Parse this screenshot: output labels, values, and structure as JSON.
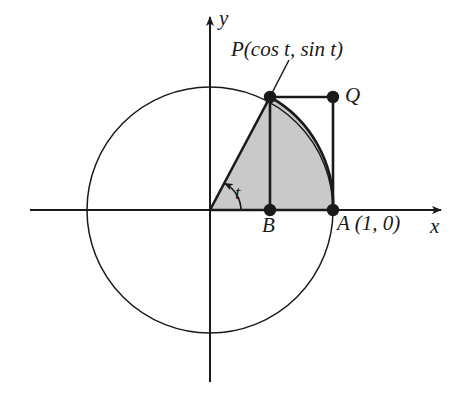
{
  "figure": {
    "kind": "unit-circle-geometry-diagram",
    "background_color": "#ffffff",
    "stroke_color": "#1a1a1a",
    "shade_color": "#c9c9c9",
    "axes": {
      "x_label": "x",
      "y_label": "y",
      "origin_px": [
        210,
        210
      ]
    },
    "circle": {
      "center_px": [
        210,
        210
      ],
      "radius_px": 123,
      "radius_value": 1
    },
    "points": [
      {
        "id": "P",
        "label": "P(cos t, sin t)",
        "short": "P",
        "px": [
          270,
          97
        ],
        "unit_coords": "(cos t, sin t)"
      },
      {
        "id": "Q",
        "label": "Q",
        "short": "Q",
        "px": [
          333,
          97
        ],
        "unit_coords": "(1, sin t)"
      },
      {
        "id": "A",
        "label": "A (1, 0)",
        "short": "A",
        "px": [
          333,
          210
        ],
        "unit_coords": "(1, 0)"
      },
      {
        "id": "B",
        "label": "B",
        "short": "B",
        "px": [
          270,
          210
        ],
        "unit_coords": "(cos t, 0)"
      }
    ],
    "angle": {
      "label": "t",
      "vertex_px": [
        210,
        210
      ],
      "from_deg": 0,
      "to_deg": 62,
      "arc_radius_px": 31
    },
    "shaded_region": {
      "description": "circular sector-like region bounded by OP, arc PA, and AO",
      "fill": "#c9c9c9"
    },
    "segments": [
      {
        "from": "O",
        "to": "P",
        "style": "solid"
      },
      {
        "from": "P",
        "to": "B",
        "style": "solid"
      },
      {
        "from": "P",
        "to": "Q",
        "style": "solid"
      },
      {
        "from": "Q",
        "to": "A",
        "style": "solid"
      },
      {
        "from": "O",
        "to": "A",
        "style": "solid"
      }
    ],
    "leader_line": {
      "from_px": [
        289,
        60
      ],
      "to_px": [
        271,
        94
      ]
    }
  }
}
